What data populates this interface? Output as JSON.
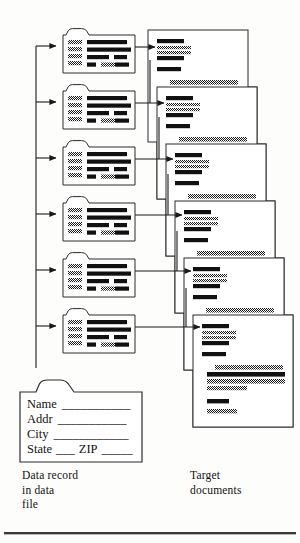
{
  "figure": {
    "background_color": "#fdfdfb",
    "ink_color": "#111111",
    "line_color": "#3a3a3a",
    "hatch_color": "#555555"
  },
  "captions": {
    "left": "Data record\nin data\nfile",
    "right": "Target\ndocuments"
  },
  "record_card": {
    "fields": [
      {
        "label": "Name",
        "rule": "___________"
      },
      {
        "label": "Addr",
        "rule": "___________"
      },
      {
        "label": "City",
        "rule": "____________"
      },
      {
        "label": "State",
        "rule": "___",
        "label2": "ZIP",
        "rule2": "_____"
      }
    ]
  },
  "data_records": {
    "count": 6,
    "label": "folder-record",
    "rows": [
      {
        "index": 1,
        "y": 28
      },
      {
        "index": 2,
        "y": 84
      },
      {
        "index": 3,
        "y": 140
      },
      {
        "index": 4,
        "y": 196
      },
      {
        "index": 5,
        "y": 252
      },
      {
        "index": 6,
        "y": 308
      }
    ]
  },
  "target_documents": {
    "count": 6,
    "label": "target-document",
    "sheets": [
      {
        "index": 1,
        "x": 148,
        "y": 30
      },
      {
        "index": 2,
        "x": 157,
        "y": 87
      },
      {
        "index": 3,
        "x": 166,
        "y": 144
      },
      {
        "index": 4,
        "x": 175,
        "y": 201
      },
      {
        "index": 5,
        "x": 184,
        "y": 258
      },
      {
        "index": 6,
        "x": 193,
        "y": 315
      }
    ]
  },
  "connectors": {
    "trunk_label": "data-flow-trunk",
    "arrow_label": "merge-arrow",
    "count": 6
  }
}
